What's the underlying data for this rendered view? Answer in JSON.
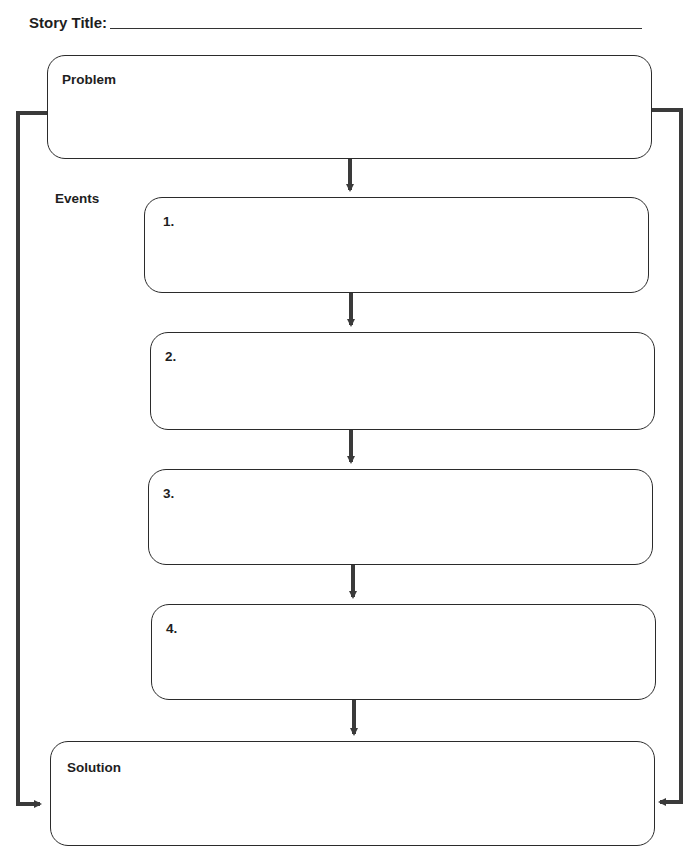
{
  "header": {
    "story_title_label": "Story Title:",
    "story_title_value": ""
  },
  "diagram": {
    "problem": {
      "label": "Problem",
      "value": ""
    },
    "events_label": "Events",
    "events": [
      {
        "label": "1.",
        "value": ""
      },
      {
        "label": "2.",
        "value": ""
      },
      {
        "label": "3.",
        "value": ""
      },
      {
        "label": "4.",
        "value": ""
      }
    ],
    "solution": {
      "label": "Solution",
      "value": ""
    },
    "line_color": "#3a3a3a"
  }
}
